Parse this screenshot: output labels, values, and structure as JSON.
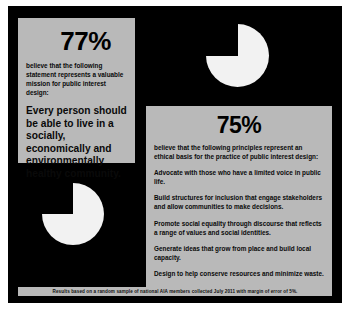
{
  "poster": {
    "background_color": "#000000",
    "panel_color": "#b9b9b9",
    "pie_color": "#f2f2f2",
    "footnote": "Results based on a random sample of national AIA members collected July 2011 with margin of error of 5%."
  },
  "left_panel": {
    "stat": "77%",
    "lede": "believe that the following statement represents a valuable mission for public interest design:",
    "statement": "Every person should be able to live in a socially, economically and environmentally healthy community."
  },
  "right_panel": {
    "stat": "75%",
    "lede": "believe that the following principles represent an ethical basis for the practice of public interest design:",
    "principles": [
      "Advocate with those who have a limited voice in public life.",
      "Build structures for inclusion that engage stakeholders and allow communities to make decisions.",
      "Promote social equality through discourse that reflects a range of values and social identities.",
      "Generate ideas that grow from place and build local capacity.",
      "Design to help conserve resources and minimize waste."
    ]
  },
  "chart_data": [
    {
      "type": "pie",
      "title": "77%",
      "categories": [
        "believe",
        "do not believe"
      ],
      "values": [
        77,
        23
      ],
      "colors": [
        "#f2f2f2",
        "#000000"
      ],
      "start_angle_deg": 0,
      "position": "top-right"
    },
    {
      "type": "pie",
      "title": "75%",
      "categories": [
        "believe",
        "do not believe"
      ],
      "values": [
        75,
        25
      ],
      "colors": [
        "#f2f2f2",
        "#000000"
      ],
      "start_angle_deg": 0,
      "position": "bottom-left"
    }
  ]
}
